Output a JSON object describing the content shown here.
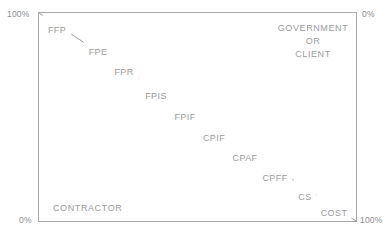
{
  "axes": {
    "top_left": "100%",
    "top_right": "0%",
    "bottom_left": "0%",
    "bottom_right": "100%"
  },
  "zones": {
    "government": "GOVERNMENT\nOR\nCLIENT",
    "government_line1": "GOVERNMENT",
    "government_line2": "OR",
    "government_line3": "CLIENT",
    "contractor": "CONTRACTOR"
  },
  "colors": {
    "line": "#9a9a9a",
    "border": "#a9a9a9",
    "text": "#9a9a9a",
    "background": "#ffffff"
  },
  "chart_data": {
    "type": "line",
    "title": "",
    "xlabel": "",
    "ylabel": "",
    "xlim": [
      0,
      100
    ],
    "ylim": [
      0,
      100
    ],
    "grid": false,
    "legend": "none",
    "annotations": [
      "GOVERNMENT OR CLIENT",
      "CONTRACTOR"
    ],
    "axis_corner_labels": {
      "top_left": "100%",
      "top_right": "0%",
      "bottom_left": "0%",
      "bottom_right": "100%"
    },
    "series": [
      {
        "name": "Contract type risk continuum",
        "x": [
          0,
          100
        ],
        "y": [
          100,
          0
        ]
      }
    ],
    "categories": [
      "FFP",
      "FPE",
      "FPR",
      "FPIS",
      "FPIF",
      "CPIF",
      "CPAF",
      "CPFF",
      "CS",
      "COST"
    ],
    "points": [
      {
        "label": "FFP",
        "x": 8,
        "y": 91,
        "px": 57,
        "py": 30
      },
      {
        "label": "FPE",
        "x": 19,
        "y": 81,
        "px": 98,
        "py": 52
      },
      {
        "label": "FPR",
        "x": 31,
        "y": 71,
        "px": 124,
        "py": 72
      },
      {
        "label": "FPIS",
        "x": 42,
        "y": 60,
        "px": 156,
        "py": 96
      },
      {
        "label": "FPIF",
        "x": 52,
        "y": 51,
        "px": 185,
        "py": 117
      },
      {
        "label": "CPIF",
        "x": 62,
        "y": 42,
        "px": 214,
        "py": 138
      },
      {
        "label": "CPAF",
        "x": 72,
        "y": 33,
        "px": 245,
        "py": 158
      },
      {
        "label": "CPFF",
        "x": 81,
        "y": 24,
        "px": 275,
        "py": 178
      },
      {
        "label": "CS",
        "x": 89,
        "y": 17,
        "px": 305,
        "py": 197
      },
      {
        "label": "COST",
        "x": 96,
        "y": 10,
        "px": 334,
        "py": 213
      }
    ]
  }
}
